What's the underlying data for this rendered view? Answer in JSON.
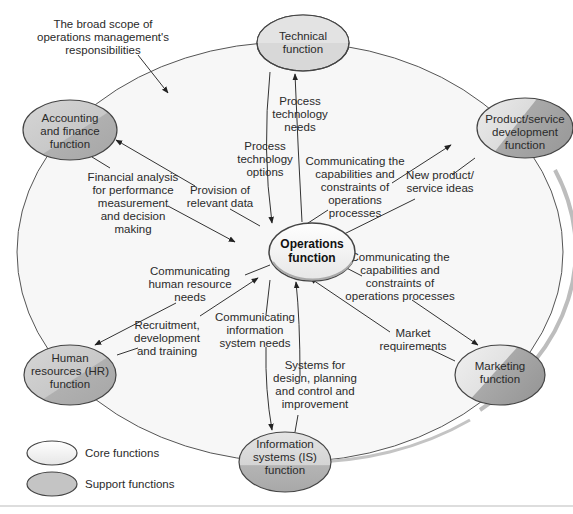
{
  "title_note": [
    "The broad scope of",
    "operations management's",
    "responsibilities"
  ],
  "colors": {
    "core_fill": "#f2f2f2",
    "support_fill": "#c9c9c9",
    "support_shade": "#a9a9a9",
    "scope_fill": "#f7f7f7",
    "scope_edge": "#b5b5b5",
    "line": "#333333",
    "text": "#2a2a2a"
  },
  "nodes": {
    "operations": [
      "Operations",
      "function"
    ],
    "technical": [
      "Technical",
      "function"
    ],
    "accounting": [
      "Accounting",
      "and finance",
      "function"
    ],
    "product": [
      "Product/service",
      "development",
      "function"
    ],
    "hr": [
      "Human",
      "resources (HR)",
      "function"
    ],
    "marketing": [
      "Marketing",
      "function"
    ],
    "is": [
      "Information",
      "systems (IS)",
      "function"
    ]
  },
  "flows": {
    "process_tech_options": [
      "Process",
      "technology",
      "options"
    ],
    "process_tech_needs": [
      "Process",
      "technology",
      "needs"
    ],
    "financial_analysis": [
      "Financial analysis",
      "for performance",
      "measurement",
      "and decision",
      "making"
    ],
    "provision_data": [
      "Provision of",
      "relevant data"
    ],
    "comm_capabilities_product": [
      "Communicating the",
      "capabilities and",
      "constraints of",
      "operations",
      "processes"
    ],
    "new_product_ideas": [
      "New product/",
      "service ideas"
    ],
    "comm_capabilities_marketing": [
      "Communicating the",
      "capabilities and",
      "constraints of",
      "operations processes"
    ],
    "market_requirements": [
      "Market",
      "requirements"
    ],
    "comm_hr_needs": [
      "Communicating",
      "human resource",
      "needs"
    ],
    "recruitment": [
      "Recruitment,",
      "development",
      "and training"
    ],
    "comm_is_needs": [
      "Communicating",
      "information",
      "system needs"
    ],
    "systems_design": [
      "Systems for",
      "design, planning",
      "and control and",
      "improvement"
    ]
  },
  "legend": {
    "core": "Core functions",
    "support": "Support functions"
  }
}
